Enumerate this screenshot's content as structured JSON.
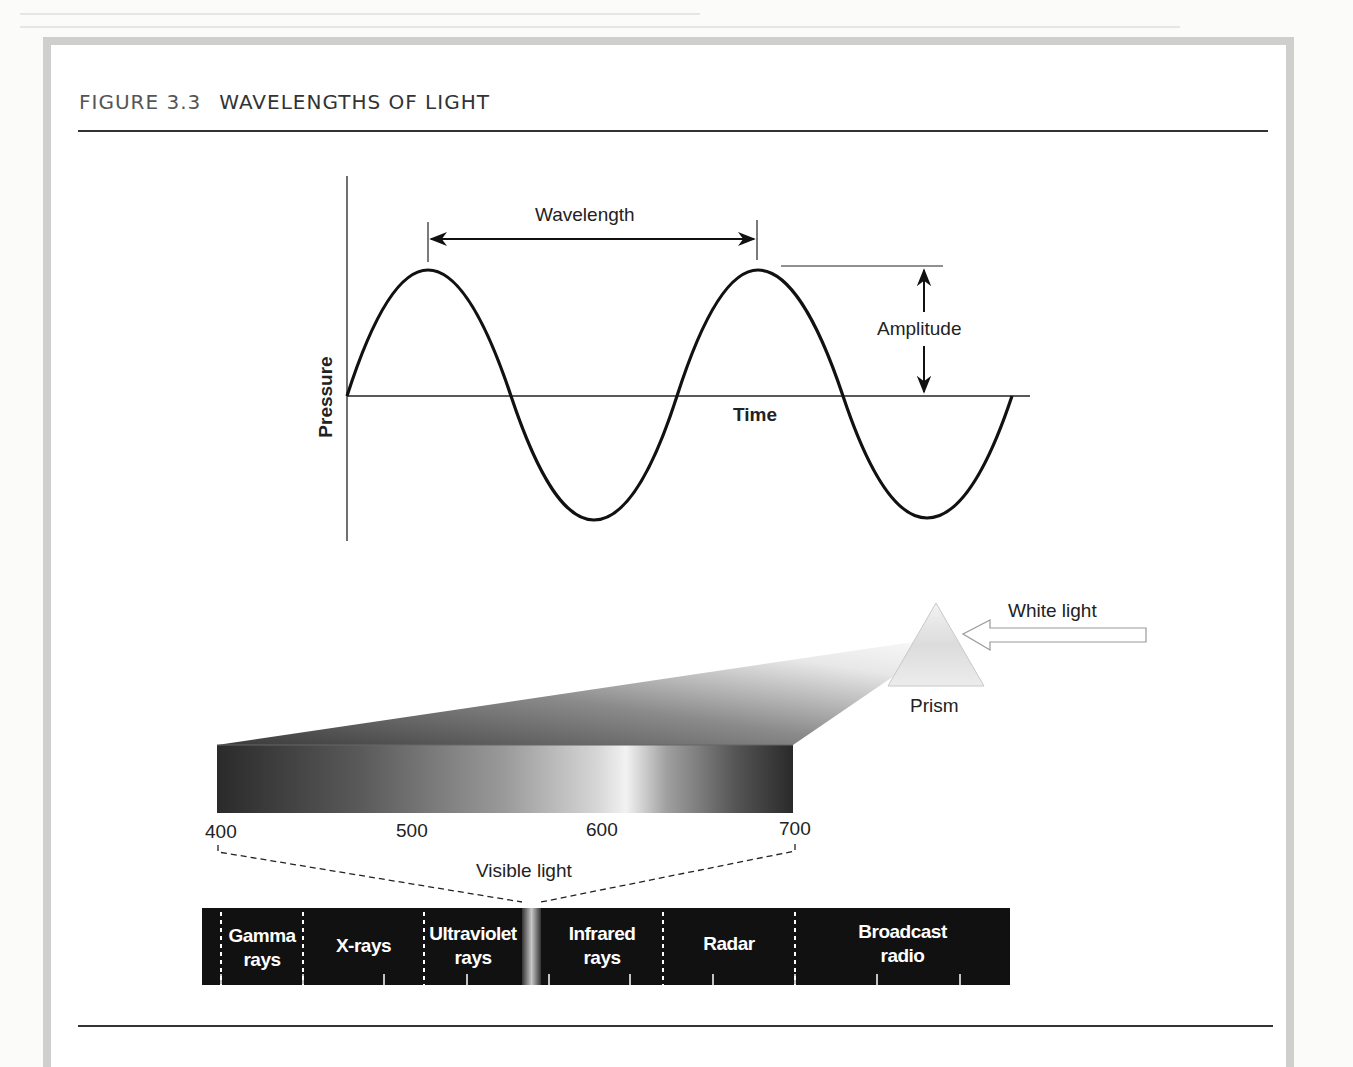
{
  "figure": {
    "number": "FIGURE 3.3",
    "title": "WAVELENGTHS OF LIGHT"
  },
  "wave_diagram": {
    "y_axis_label": "Pressure",
    "x_axis_label": "Time",
    "wavelength_label": "Wavelength",
    "amplitude_label": "Amplitude",
    "cycles": 2
  },
  "prism_diagram": {
    "input_label": "White light",
    "prism_label": "Prism"
  },
  "visible_spectrum": {
    "ticks": [
      "400",
      "500",
      "600",
      "700"
    ],
    "unit_label": "Visible light"
  },
  "em_spectrum": {
    "bands": [
      {
        "line1": "Gamma",
        "line2": "rays"
      },
      {
        "line1": "X-rays",
        "line2": ""
      },
      {
        "line1": "Ultraviolet",
        "line2": "rays"
      },
      {
        "line1": "Infrared",
        "line2": "rays"
      },
      {
        "line1": "Radar",
        "line2": ""
      },
      {
        "line1": "Broadcast",
        "line2": "radio"
      }
    ]
  },
  "colors": {
    "frame": "#cfcfcd",
    "band_bg": "#111111",
    "line": "#111111",
    "text": "#222222"
  }
}
